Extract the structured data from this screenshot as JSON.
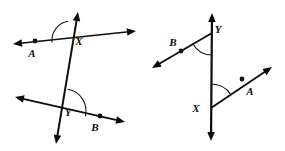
{
  "figure": {
    "title": "Two transversal angle diagrams",
    "width": 285,
    "height": 151,
    "background_color": "#ffffff",
    "line_color": "#0d0d0d",
    "arc_color": "#1a1a1a",
    "label_color": "#0d0d0d"
  },
  "diagrams": [
    {
      "id": "left-diagram",
      "name": "transversal-crossing-two-lines",
      "labels": {
        "point_a": "A",
        "point_b": "B",
        "vertex_x": "X",
        "vertex_y": "Y"
      },
      "lines": [
        {
          "name": "transversal-steep-line",
          "x1": 78,
          "y1": 12,
          "x2": 56,
          "y2": 144,
          "arrow_start": true,
          "arrow_end": true,
          "stroke_width": 2.0
        },
        {
          "name": "upper-line-through-a",
          "x1": 13,
          "y1": 44,
          "x2": 136,
          "y2": 31,
          "arrow_start": true,
          "arrow_end": true,
          "stroke_width": 1.7
        },
        {
          "name": "lower-line-through-b",
          "x1": 15,
          "y1": 97,
          "x2": 125,
          "y2": 122,
          "arrow_start": true,
          "arrow_end": true,
          "stroke_width": 1.8
        }
      ],
      "vertices": [
        {
          "name": "vertex-x",
          "label": "X",
          "x": 71,
          "y": 40,
          "label_x": 79,
          "label_y": 45
        },
        {
          "name": "vertex-y",
          "label": "Y",
          "x": 64,
          "y": 111,
          "label_x": 68,
          "label_y": 116
        }
      ],
      "points": [
        {
          "name": "point-a",
          "label": "A",
          "x": 35,
          "y": 41,
          "label_x": 32,
          "label_y": 57
        },
        {
          "name": "point-b",
          "label": "B",
          "x": 100,
          "y": 116,
          "label_x": 95,
          "label_y": 131
        }
      ],
      "arcs": [
        {
          "name": "angle-arc-at-x",
          "cx": 71,
          "cy": 40,
          "r": 19,
          "start_deg": 174,
          "end_deg": 260
        },
        {
          "name": "angle-arc-at-y",
          "cx": 64,
          "cy": 111,
          "r": 22,
          "start_deg": 13,
          "end_deg": -80
        }
      ]
    },
    {
      "id": "right-diagram",
      "name": "vertical-line-with-two-rays",
      "labels": {
        "point_a": "A",
        "point_b": "B",
        "vertex_x": "X",
        "vertex_y": "Y"
      },
      "lines": [
        {
          "name": "vertical-line",
          "x1": 212,
          "y1": 13,
          "x2": 211,
          "y2": 141,
          "arrow_start": true,
          "arrow_end": true,
          "stroke_width": 2.2
        },
        {
          "name": "ray-through-b",
          "x1": 212,
          "y1": 33,
          "x2": 152,
          "y2": 68,
          "arrow_start": false,
          "arrow_end": true,
          "stroke_width": 1.9
        },
        {
          "name": "ray-through-a",
          "x1": 211,
          "y1": 108,
          "x2": 272,
          "y2": 67,
          "arrow_start": false,
          "arrow_end": true,
          "stroke_width": 1.9
        }
      ],
      "vertices": [
        {
          "name": "vertex-y",
          "label": "Y",
          "x": 212,
          "y": 33,
          "label_x": 218,
          "label_y": 33
        },
        {
          "name": "vertex-x",
          "label": "X",
          "x": 211,
          "y": 108,
          "label_x": 196,
          "label_y": 112
        }
      ],
      "points": [
        {
          "name": "point-b",
          "label": "B",
          "x": 181,
          "y": 51,
          "label_x": 173,
          "label_y": 46
        },
        {
          "name": "point-a",
          "label": "A",
          "x": 242,
          "y": 79,
          "label_x": 250,
          "label_y": 95
        }
      ],
      "arcs": [
        {
          "name": "angle-arc-at-y",
          "cx": 212,
          "cy": 33,
          "r": 22,
          "start_deg": 90,
          "end_deg": 150
        },
        {
          "name": "angle-arc-at-x",
          "cx": 211,
          "cy": 108,
          "r": 24,
          "start_deg": -90,
          "end_deg": -34
        }
      ]
    }
  ]
}
